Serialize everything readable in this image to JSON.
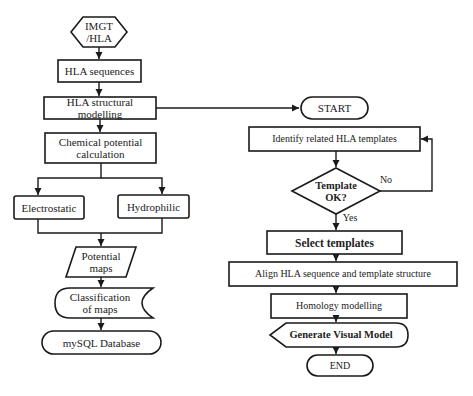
{
  "diagram": {
    "type": "flowchart",
    "left_flow": {
      "source": "IMGT\n/HLA",
      "step1": "HLA sequences",
      "step2": "HLA structural modelling",
      "step3": "Chemical potential\ncalculation",
      "branch_left": "Electrostatic",
      "branch_right": "Hydrophilic",
      "output": "Potential\nmaps",
      "classification": "Classification\nof maps",
      "database": "mySQL Database"
    },
    "right_flow": {
      "start": "START",
      "identify": "Identify related HLA templates",
      "decision": "Template\nOK?",
      "no_label": "No",
      "yes_label": "Yes",
      "select": "Select templates",
      "align": "Align HLA sequence and template structure",
      "homology": "Homology modelling",
      "generate": "Generate Visual Model",
      "end": "END"
    },
    "colors": {
      "stroke": "#1a1a1a",
      "fill": "#ffffff",
      "text": "#222222"
    }
  }
}
